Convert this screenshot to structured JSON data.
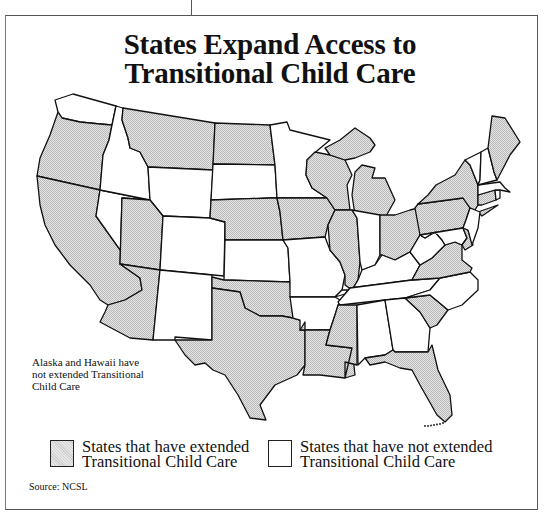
{
  "title": {
    "line1": "States Expand Access to",
    "line2": "Transitional Child Care"
  },
  "note": {
    "line1": "Alaska and Hawaii have",
    "line2": "not extended Transitional",
    "line3": "Child Care"
  },
  "legend": {
    "extended": {
      "line1": "States that have extended",
      "line2": "Transitional Child Care",
      "color": "#d0d0d0"
    },
    "not_extended": {
      "line1": "States that have not extended",
      "line2": "Transitional Child Care",
      "color": "#ffffff"
    }
  },
  "source": "Source:  NCSL",
  "map": {
    "extended_states": [
      "OR",
      "CA",
      "MT",
      "ND",
      "UT",
      "NE",
      "AZ",
      "TX",
      "OK",
      "LA",
      "MS",
      "IA",
      "WI",
      "MI",
      "IL",
      "OH",
      "PA",
      "NY",
      "CT",
      "DE",
      "VA",
      "SC",
      "FL",
      "ME"
    ],
    "not_extended_states": [
      "WA",
      "ID",
      "NV",
      "WY",
      "SD",
      "CO",
      "KS",
      "NM",
      "MN",
      "MO",
      "AR",
      "IN",
      "KY",
      "TN",
      "AL",
      "GA",
      "NC",
      "WV",
      "MD",
      "NJ",
      "RI",
      "MA",
      "VT",
      "NH",
      "AK",
      "HI"
    ],
    "states": [
      {
        "id": "WA",
        "pts": "55,100 73,94 116,106 112,125 100,124 80,122 62,118 58,112"
      },
      {
        "id": "OR",
        "pts": "58,112 62,118 80,122 100,124 112,125 109,140 103,155 100,190 37,176 40,158 50,135"
      },
      {
        "id": "CA",
        "pts": "37,176 100,190 96,216 140,278 142,290 125,300 108,305 100,300 90,285 70,265 55,245 45,225 40,205"
      },
      {
        "id": "NV",
        "pts": "100,190 150,200 122,198 120,264 140,278 96,216"
      },
      {
        "id": "ID",
        "pts": "116,106 123,108 122,120 128,138 130,148 140,152 148,167 150,200 100,190 103,155 109,140 112,125"
      },
      {
        "id": "MT",
        "pts": "123,108 215,123 213,170 148,167 140,152 130,148 128,138 122,120"
      },
      {
        "id": "WY",
        "pts": "148,167 213,170 210,218 163,216 150,200"
      },
      {
        "id": "UT",
        "pts": "122,198 150,200 163,216 160,270 120,264"
      },
      {
        "id": "CO",
        "pts": "163,216 210,218 225,222 224,276 160,270"
      },
      {
        "id": "AZ",
        "pts": "120,264 160,270 153,340 130,338 100,322 105,312 108,305 125,300 142,290 140,278"
      },
      {
        "id": "NM",
        "pts": "160,270 212,275 212,340 175,337 175,340 153,340"
      },
      {
        "id": "ND",
        "pts": "215,123 270,125 275,165 213,164"
      },
      {
        "id": "SD",
        "pts": "213,164 275,165 277,198 270,198 211,200"
      },
      {
        "id": "NE",
        "pts": "211,200 270,198 277,198 280,212 283,240 225,240 225,222 210,218"
      },
      {
        "id": "KS",
        "pts": "225,240 283,240 288,248 290,282 224,280"
      },
      {
        "id": "OK",
        "pts": "212,277 224,280 290,282 293,318 282,316 260,316 245,308 240,292 212,288"
      },
      {
        "id": "TX",
        "pts": "175,340 212,340 212,288 240,292 245,308 260,316 282,316 293,318 305,322 305,365 297,375 275,385 260,405 266,420 250,418 238,395 225,375 213,370 205,363 195,365 185,355"
      },
      {
        "id": "MN",
        "pts": "270,125 287,122 290,130 310,135 330,140 318,150 307,160 306,175 312,188 327,198 277,198 275,165"
      },
      {
        "id": "IA",
        "pts": "277,198 327,198 335,210 328,225 325,237 283,240 280,212"
      },
      {
        "id": "MO",
        "pts": "283,240 325,237 330,250 340,262 345,275 342,290 335,297 290,297 290,282 288,248"
      },
      {
        "id": "AR",
        "pts": "290,297 335,297 340,300 335,315 330,330 300,330 300,320 293,318"
      },
      {
        "id": "LA",
        "pts": "300,330 330,330 326,345 352,348 355,375 345,378 320,375 303,375 305,365 305,322"
      },
      {
        "id": "WI",
        "pts": "307,160 315,152 330,155 345,160 352,175 347,185 350,210 335,210 327,198 312,188 306,175"
      },
      {
        "id": "MI-upper",
        "pts": "325,148 340,140 355,128 370,138 375,145 370,152 355,158 345,160 330,155"
      },
      {
        "id": "MI",
        "pts": "355,172 362,165 375,168 372,178 385,178 395,200 385,218 365,220 355,215 352,195"
      },
      {
        "id": "IL",
        "pts": "335,210 352,210 357,218 360,262 358,280 352,290 345,285 345,275 340,262 330,250 328,225"
      },
      {
        "id": "IN",
        "pts": "352,210 380,215 380,255 375,265 362,270 360,262 357,218"
      },
      {
        "id": "OH",
        "pts": "380,215 395,215 410,210 418,208 420,235 410,252 395,260 382,255 380,255"
      },
      {
        "id": "KY",
        "pts": "335,297 342,290 352,290 358,280 362,270 375,265 382,255 395,260 410,252 420,265 412,280 350,288 345,294"
      },
      {
        "id": "TN",
        "pts": "338,302 345,294 350,288 412,280 440,278 430,290 405,298 385,300 340,305"
      },
      {
        "id": "MS",
        "pts": "330,330 335,315 338,305 357,305 357,365 345,362 345,378 352,348 326,345"
      },
      {
        "id": "AL",
        "pts": "357,305 385,300 393,350 385,355 365,358 358,365"
      },
      {
        "id": "GA",
        "pts": "385,300 405,298 420,312 430,328 428,352 395,352 393,350"
      },
      {
        "id": "FL",
        "pts": "365,358 385,355 393,350 395,352 428,352 432,345 438,370 450,395 452,415 445,422 437,415 420,385 412,370 400,368 385,362 370,365"
      },
      {
        "id": "SC",
        "pts": "405,298 430,295 448,310 437,325 430,328 420,312"
      },
      {
        "id": "NC",
        "pts": "440,278 470,272 478,280 478,290 462,305 448,310 430,295 405,298 430,290"
      },
      {
        "id": "VA",
        "pts": "412,280 420,265 432,258 445,245 455,242 462,245 462,260 472,268 470,272 440,278"
      },
      {
        "id": "WV",
        "pts": "410,252 420,235 425,238 435,232 442,240 445,245 432,258 420,265"
      },
      {
        "id": "PA",
        "pts": "415,208 418,204 463,198 470,208 466,220 463,228 420,235"
      },
      {
        "id": "NY",
        "pts": "418,204 428,195 436,185 455,175 465,160 470,165 478,185 478,195 478,205 475,210 470,208 463,198"
      },
      {
        "id": "NY-LI",
        "pts": "478,212 498,205 482,216"
      },
      {
        "id": "MD",
        "pts": "420,235 463,228 467,238 462,245 455,242 445,245 442,240 435,232 425,238"
      },
      {
        "id": "DE",
        "pts": "463,228 468,230 473,245 465,250 462,245 467,238"
      },
      {
        "id": "NJ",
        "pts": "466,220 470,208 475,210 480,212 478,228 472,245 468,230 463,228"
      },
      {
        "id": "CT",
        "pts": "478,195 495,190 496,200 482,205 478,205"
      },
      {
        "id": "RI",
        "pts": "495,190 500,190 500,198 496,200"
      },
      {
        "id": "MA",
        "pts": "478,185 500,182 505,188 510,192 500,190 495,190 478,195"
      },
      {
        "id": "VT",
        "pts": "465,160 481,152 480,180 478,185 470,165"
      },
      {
        "id": "NH",
        "pts": "481,152 488,148 494,172 497,180 478,185 480,180"
      },
      {
        "id": "ME",
        "pts": "488,148 492,116 505,118 520,142 510,155 497,180 494,172"
      }
    ]
  }
}
